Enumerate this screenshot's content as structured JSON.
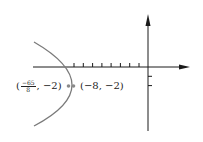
{
  "diagram": {
    "title": "",
    "type": "parabola-with-focus-and-vertex",
    "colors": {
      "axes": "#1a1a1a",
      "curve": "#7a7a7a",
      "points": "#8a8a8a",
      "text": "#222222"
    },
    "axes": {
      "x_ticks": [
        -8,
        -7,
        -6,
        -5,
        -4,
        -3,
        -2,
        -1
      ],
      "y_ticks": [
        -1,
        -2
      ]
    },
    "points": [
      {
        "name": "focus",
        "x": "-65/8",
        "y": -2,
        "label_open": "(",
        "label_num": "−65",
        "label_den": "8",
        "label_rest": ", −2)"
      },
      {
        "name": "vertex",
        "x": -8,
        "y": -2,
        "label": "(−8, −2)"
      }
    ]
  }
}
